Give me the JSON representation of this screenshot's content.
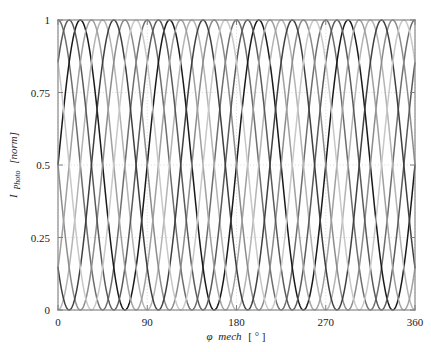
{
  "figure": {
    "background_color": "#ffffff",
    "axes_color": "#808080",
    "grid_color": "#c8c8c8"
  },
  "axis_titles": {
    "x_symbol": "φ",
    "x_name": "mech",
    "x_unit": "[ ° ]",
    "y_symbol": "I",
    "y_sub": "Photo",
    "y_unit": "[norm]"
  },
  "chart_data": {
    "type": "line",
    "title": "",
    "subtitle": "",
    "xlabel": "φ mech [ ° ]",
    "ylabel": "I Photo [norm]",
    "xlim": [
      0,
      360
    ],
    "ylim": [
      0,
      1
    ],
    "xticks": [
      0,
      90,
      180,
      270,
      360
    ],
    "xtick_labels": [
      "0",
      "90",
      "180",
      "270",
      "360"
    ],
    "yticks": [
      0,
      0.25,
      0.5,
      0.75,
      1
    ],
    "ytick_labels": [
      "0",
      "0.25",
      "0.5",
      "0.75",
      "1"
    ],
    "grid": true,
    "grid_style": "dotted",
    "legend": false,
    "legend_position": "none",
    "period_deg": 90,
    "amplitude": 0.5,
    "offset": 0.5,
    "series": [
      {
        "name": "signal-1",
        "color": "#6e6e6e",
        "phase_deg": 0,
        "formula": "0.5 + 0.5*cos(4*(x-0))"
      },
      {
        "name": "signal-2",
        "color": "#1a1a1a",
        "phase_deg": 22.5,
        "formula": "0.5 + 0.5*cos(4*(x-22.5))"
      },
      {
        "name": "signal-3",
        "color": "#b4b4b4",
        "phase_deg": 45,
        "formula": "0.5 + 0.5*cos(4*(x-45))"
      },
      {
        "name": "signal-4",
        "color": "#8c8c8c",
        "phase_deg": 67.5,
        "formula": "0.5 + 0.5*cos(4*(x-67.5))"
      },
      {
        "name": "signal-5",
        "color": "#5a5a5a",
        "phase_deg": 11.25,
        "formula": "0.5 + 0.5*cos(4*(x-11.25))"
      },
      {
        "name": "signal-6",
        "color": "#a0a0a0",
        "phase_deg": 33.75,
        "formula": "0.5 + 0.5*cos(4*(x-33.75))"
      },
      {
        "name": "signal-7",
        "color": "#404040",
        "phase_deg": 56.25,
        "formula": "0.5 + 0.5*cos(4*(x-56.25))"
      },
      {
        "name": "signal-8",
        "color": "#c8c8c8",
        "phase_deg": 78.75,
        "formula": "0.5 + 0.5*cos(4*(x-78.75))"
      }
    ]
  }
}
